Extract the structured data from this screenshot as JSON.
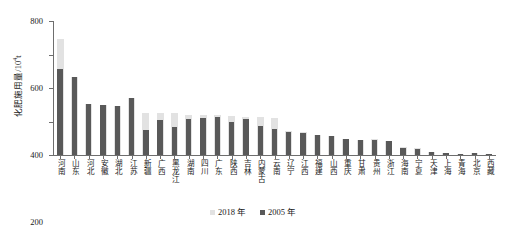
{
  "chart_data": {
    "type": "bar",
    "title": "",
    "subtitle": "",
    "xlabel": "",
    "ylabel": "化肥施用量/10⁴t",
    "ylabel_base": "化肥施用量/10",
    "ylabel_sup": "4",
    "ylabel_unit": "t",
    "ylim": [
      0,
      800
    ],
    "ytick_labels": [
      "0",
      "200",
      "400",
      "600",
      "800"
    ],
    "ytick_values": [
      0,
      200,
      400,
      600,
      800
    ],
    "grid": false,
    "legend_position": "bottom-center",
    "categories": [
      "河南",
      "山东",
      "河北",
      "安徽",
      "湖北",
      "江苏",
      "新疆",
      "广西",
      "黑龙江",
      "湖南",
      "四川",
      "广东",
      "陕西",
      "吉林",
      "内蒙古",
      "云南",
      "辽宁",
      "江西",
      "福建",
      "山西",
      "重庆",
      "甘肃",
      "贵州",
      "浙江",
      "海南",
      "宁夏",
      "天津",
      "上海",
      "青海",
      "北京",
      "西藏"
    ],
    "series": [
      {
        "name": "2018 年",
        "color": "#e2e2e2",
        "values": [
          691,
          466,
          305,
          298,
          292,
          340,
          248,
          250,
          250,
          236,
          239,
          238,
          230,
          226,
          225,
          220,
          143,
          135,
          120,
          113,
          96,
          90,
          96,
          84,
          50,
          40,
          19,
          12,
          9,
          13,
          5
        ]
      },
      {
        "name": "2005 年",
        "color": "#595959",
        "values": [
          515,
          464,
          303,
          296,
          290,
          338,
          151,
          210,
          168,
          216,
          222,
          228,
          196,
          217,
          171,
          153,
          139,
          133,
          118,
          112,
          95,
          89,
          88,
          83,
          44,
          35,
          18,
          12,
          8,
          12,
          4
        ]
      }
    ]
  },
  "legend": {
    "items": [
      {
        "label": "2018 年",
        "color": "#e2e2e2"
      },
      {
        "label": "2005 年",
        "color": "#595959"
      }
    ]
  },
  "axis": {
    "y_title": "化肥施用量/10",
    "y_title_sup": "4",
    "y_title_tail": "t"
  }
}
